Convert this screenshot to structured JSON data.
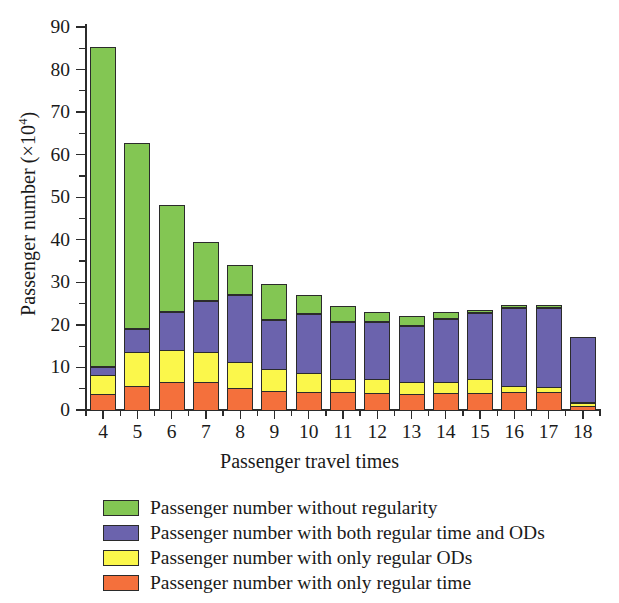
{
  "chart_data": {
    "type": "bar",
    "stacked": true,
    "title": "",
    "xlabel": "Passenger travel times",
    "ylabel": "Passenger number (×10⁴)",
    "ylabel_base": "Passenger number (×10",
    "ylabel_exp": "4",
    "ylabel_tail": ")",
    "categories": [
      "4",
      "5",
      "6",
      "7",
      "8",
      "9",
      "10",
      "11",
      "12",
      "13",
      "14",
      "15",
      "16",
      "17",
      "18"
    ],
    "ylim": [
      0,
      93
    ],
    "yticks": [
      0,
      10,
      20,
      30,
      40,
      50,
      60,
      70,
      80,
      90
    ],
    "ytick_labels": [
      "0",
      "10",
      "20",
      "30",
      "40",
      "50",
      "60",
      "70",
      "80",
      "90"
    ],
    "grid": false,
    "legend_position": "below-plot",
    "series": [
      {
        "name": "Passenger number with only regular time",
        "color": "#f4703c",
        "values": [
          4.0,
          6.0,
          6.8,
          6.8,
          5.5,
          4.8,
          4.5,
          4.5,
          4.3,
          4.0,
          4.2,
          4.3,
          4.5,
          4.5,
          1.3
        ]
      },
      {
        "name": "Passenger number with only regular ODs",
        "color": "#fbf74b",
        "values": [
          4.8,
          8.2,
          8.0,
          7.5,
          6.5,
          5.5,
          4.8,
          3.5,
          3.5,
          3.2,
          3.0,
          3.5,
          1.8,
          1.6,
          1.0
        ]
      },
      {
        "name": "Passenger number with both regular time and ODs",
        "color": "#6b63ad",
        "values": [
          2.3,
          5.8,
          9.2,
          12.3,
          16.0,
          11.7,
          14.1,
          13.5,
          13.7,
          13.5,
          15.1,
          15.9,
          18.6,
          18.9,
          15.4
        ]
      },
      {
        "name": "Passenger number without regularity",
        "color": "#83c653",
        "values": [
          75.2,
          43.7,
          25.1,
          13.9,
          7.0,
          8.5,
          4.6,
          3.8,
          2.5,
          2.3,
          1.7,
          0.8,
          0.6,
          0.5,
          0.0
        ]
      }
    ],
    "totals": [
      86.3,
      63.7,
      49.1,
      40.5,
      35.0,
      30.5,
      28.0,
      25.3,
      24.0,
      23.0,
      24.0,
      24.5,
      25.5,
      25.5,
      17.7
    ]
  },
  "legend": {
    "items": [
      {
        "label": "Passenger number without regularity",
        "color": "#83c653"
      },
      {
        "label": "Passenger number with both regular time and ODs",
        "color": "#6b63ad"
      },
      {
        "label": "Passenger number with only regular ODs",
        "color": "#fbf74b"
      },
      {
        "label": "Passenger number with only regular time",
        "color": "#f4703c"
      }
    ]
  },
  "style": {
    "axis_color": "#2b2b2b",
    "text_color": "#1a1a1a",
    "background": "#ffffff"
  }
}
